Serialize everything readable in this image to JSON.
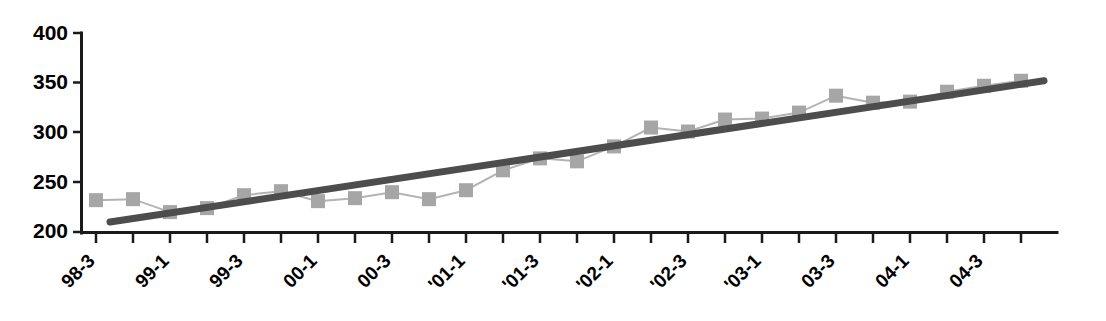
{
  "chart_data": {
    "type": "line",
    "title": "",
    "subtitle": "",
    "xlabel": "",
    "ylabel": "",
    "ylim": [
      200,
      400
    ],
    "yticks": [
      200,
      250,
      300,
      350,
      400
    ],
    "ytick_labels": [
      "200",
      "250",
      "300",
      "350",
      "400"
    ],
    "grid": false,
    "legend": "none",
    "categories": [
      "98-3",
      "98-4",
      "99-1",
      "99-2",
      "99-3",
      "99-4",
      "00-1",
      "00-2",
      "00-3",
      "00-4",
      "'01-1",
      "'01-2",
      "'01-3",
      "'01-4",
      "'02-1",
      "'02-2",
      "'02-3",
      "'02-4",
      "'03-1",
      "'03-2",
      "03-3",
      "03-4",
      "04-1",
      "04-2",
      "04-3",
      "04-4"
    ],
    "xtick_labels_shown": [
      "98-3",
      "99-1",
      "99-3",
      "00-1",
      "00-3",
      "'01-1",
      "'01-3",
      "'02-1",
      "'02-3",
      "'03-1",
      "03-3",
      "04-1",
      "04-3"
    ],
    "series": [
      {
        "name": "observed",
        "marker": "square",
        "color": "#a6a6a6",
        "line_color": "#b3b3b3",
        "values": [
          232,
          233,
          220,
          224,
          237,
          241,
          231,
          234,
          240,
          233,
          242,
          262,
          274,
          271,
          286,
          305,
          301,
          313,
          314,
          320,
          337,
          330,
          331,
          341,
          347,
          352
        ]
      },
      {
        "name": "trend",
        "marker": "none",
        "color": "#4d4d4d",
        "type": "linear-fit",
        "start_value": 210,
        "end_value": 352
      }
    ]
  },
  "axis": {
    "y_axis_name": "value-axis",
    "x_axis_name": "period-axis"
  }
}
